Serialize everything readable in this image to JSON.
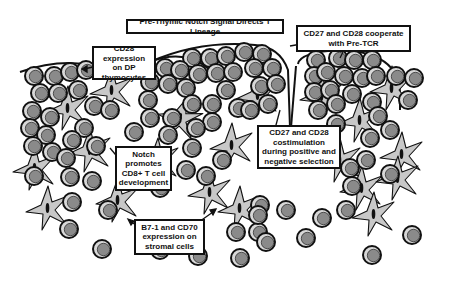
{
  "diagram": {
    "type": "biological-illustration",
    "colors": {
      "thymocyte_fill": "#8a8a8a",
      "thymocyte_ring": "#d9d9d9",
      "outline": "#111111",
      "stromal_fill": "#c9c9c9",
      "stromal_nucleus": "#111111",
      "label_bg": "#ffffff"
    },
    "labels": [
      {
        "id": "title",
        "text": "Pre-Thymic Notch Signal Directs T Lineage"
      },
      {
        "id": "cd27-cd28-pretcr",
        "text": "CD27 and CD28 cooperate with Pre-TCR"
      },
      {
        "id": "cd28-dp",
        "text": "CD28 expression on DP thymocytes"
      },
      {
        "id": "costimulation-selection",
        "text": "CD27 and CD28 costimulation during positive and negative selection"
      },
      {
        "id": "notch-cd8",
        "text": "Notch promotes CD8+ T cell development"
      },
      {
        "id": "b7-cd70-stromal",
        "text": "B7-1 and CD70 expression on stromal cells"
      }
    ],
    "legend_elements": [
      "thymocyte",
      "stromal-cell"
    ]
  }
}
